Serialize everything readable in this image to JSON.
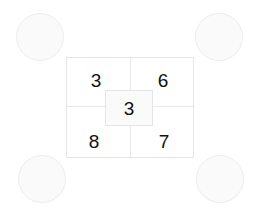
{
  "diagram": {
    "background_color": "#ffffff",
    "line_color": "#e4e5e6",
    "divider_color": "#e8e9ea",
    "circle_fill": "#fafafa",
    "text_color": "#111111",
    "wheels": [
      {
        "id": "top-left",
        "label": ""
      },
      {
        "id": "top-right",
        "label": ""
      },
      {
        "id": "bottom-left",
        "label": ""
      },
      {
        "id": "bottom-right",
        "label": ""
      }
    ],
    "quadrants": [
      {
        "id": "top-left",
        "value": "3"
      },
      {
        "id": "top-right",
        "value": "6"
      },
      {
        "id": "bottom-left",
        "value": "8"
      },
      {
        "id": "bottom-right",
        "value": "7"
      }
    ],
    "center": {
      "id": "center",
      "value": "3"
    }
  }
}
